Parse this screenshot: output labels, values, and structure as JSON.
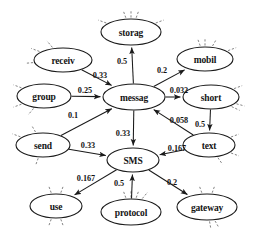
{
  "diagram": {
    "type": "directed-weighted-graph",
    "title": "",
    "background_color": "#ffffff",
    "node_fill": "#ffffff",
    "node_stroke": "#1a1a1a",
    "edge_color": "#1a1a1a",
    "stub_color": "#6d6d6d",
    "nodes": [
      {
        "id": "storag",
        "label": "storag",
        "cx": 131,
        "cy": 32,
        "rx": 30,
        "ry": 13,
        "stubs": [
          200,
          250,
          270,
          290,
          340
        ]
      },
      {
        "id": "receiv",
        "label": "receiv",
        "cx": 63,
        "cy": 60,
        "rx": 29,
        "ry": 12,
        "stubs": [
          175,
          200,
          230
        ]
      },
      {
        "id": "mobil",
        "label": "mobil",
        "cx": 205,
        "cy": 59,
        "rx": 28,
        "ry": 12,
        "stubs": [
          250,
          270,
          300,
          340
        ]
      },
      {
        "id": "group",
        "label": "group",
        "cx": 44,
        "cy": 96,
        "rx": 27,
        "ry": 12,
        "stubs": [
          130,
          160,
          200
        ]
      },
      {
        "id": "messag",
        "label": "messag",
        "cx": 134,
        "cy": 97,
        "rx": 31,
        "ry": 13,
        "stubs": []
      },
      {
        "id": "short",
        "label": "short",
        "cx": 211,
        "cy": 97,
        "rx": 28,
        "ry": 12,
        "stubs": [
          25,
          340,
          15
        ]
      },
      {
        "id": "send",
        "label": "send",
        "cx": 43,
        "cy": 145,
        "rx": 27,
        "ry": 12,
        "stubs": [
          110,
          200,
          240
        ]
      },
      {
        "id": "text",
        "label": "text",
        "cx": 209,
        "cy": 145,
        "rx": 26,
        "ry": 12,
        "stubs": [
          20,
          340,
          55
        ]
      },
      {
        "id": "SMS",
        "label": "SMS",
        "cx": 133,
        "cy": 160,
        "rx": 26,
        "ry": 12,
        "stubs": []
      },
      {
        "id": "use",
        "label": "use",
        "cx": 56,
        "cy": 206,
        "rx": 26,
        "ry": 12,
        "stubs": [
          70,
          110,
          250,
          290
        ]
      },
      {
        "id": "protocol",
        "label": "protocol",
        "cx": 131,
        "cy": 212,
        "rx": 30,
        "ry": 13,
        "stubs": [
          250,
          270,
          290,
          310
        ]
      },
      {
        "id": "gateway",
        "label": "gateway",
        "cx": 207,
        "cy": 207,
        "rx": 30,
        "ry": 13,
        "stubs": [
          60,
          80,
          250,
          290
        ]
      }
    ],
    "edges": [
      {
        "from": "receiv",
        "to": "messag",
        "weight": "0.33",
        "lx": 100,
        "ly": 75
      },
      {
        "from": "messag",
        "to": "storag",
        "weight": "0.5",
        "lx": 122,
        "ly": 61
      },
      {
        "from": "messag",
        "to": "mobil",
        "weight": "0.2",
        "lx": 162,
        "ly": 70
      },
      {
        "from": "group",
        "to": "messag",
        "weight": "0.25",
        "lx": 85,
        "ly": 90
      },
      {
        "from": "messag",
        "to": "short",
        "weight": "0.032",
        "lx": 179,
        "ly": 90
      },
      {
        "from": "send",
        "to": "messag",
        "weight": "0.1",
        "lx": 73,
        "ly": 115
      },
      {
        "from": "short",
        "to": "text",
        "weight": "0.5",
        "lx": 200,
        "ly": 124
      },
      {
        "from": "text",
        "to": "messag",
        "weight": "0.058",
        "lx": 179,
        "ly": 120
      },
      {
        "from": "messag",
        "to": "SMS",
        "weight": "0.33",
        "lx": 123,
        "ly": 133
      },
      {
        "from": "send",
        "to": "SMS",
        "weight": "0.33",
        "lx": 88,
        "ly": 145
      },
      {
        "from": "text",
        "to": "SMS",
        "weight": "0.167",
        "lx": 177,
        "ly": 148
      },
      {
        "from": "SMS",
        "to": "use",
        "weight": "0.167",
        "lx": 86,
        "ly": 178
      },
      {
        "from": "protocol",
        "to": "SMS",
        "weight": "0.5",
        "lx": 119,
        "ly": 183
      },
      {
        "from": "SMS",
        "to": "gateway",
        "weight": "0.2",
        "lx": 172,
        "ly": 182
      }
    ]
  }
}
